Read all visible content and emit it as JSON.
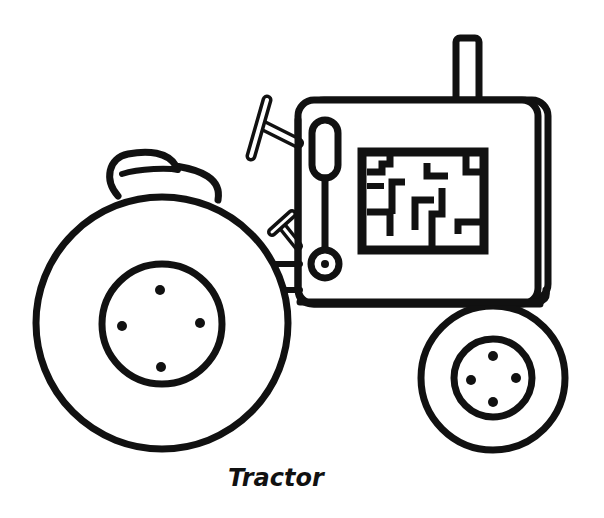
{
  "title": "Tractor",
  "caption": "Tractor",
  "colors": {
    "ink": "#111111",
    "paper": "#ffffff"
  },
  "parts": {
    "rear_wheel": "rear-wheel",
    "front_wheel": "front-wheel",
    "engine_hood": "engine-hood",
    "exhaust_pipe": "exhaust-pipe",
    "grille": "maze-grille",
    "steering_wheel": "steering-wheel",
    "seat": "seat",
    "lever": "gear-lever"
  }
}
